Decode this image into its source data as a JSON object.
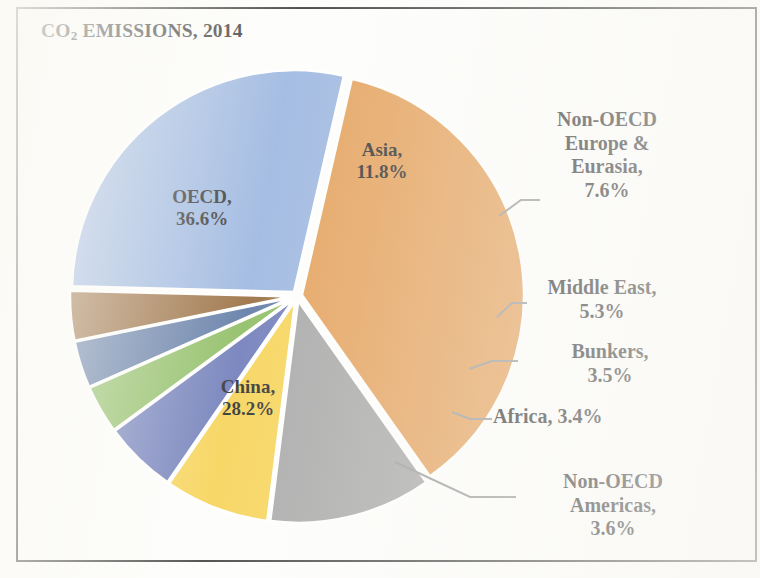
{
  "chart_data": {
    "type": "pie",
    "title": "CO2 EMISSIONS, 2014",
    "title_main": "CO",
    "title_sub": "2",
    "title_rest": " EMISSIONS, 2014",
    "xlabel": "",
    "ylabel": "",
    "legend_position": "none",
    "grid": false,
    "value_unit": "%",
    "categories": [
      "OECD",
      "Asia",
      "Non-OECD Europe & Eurasia",
      "Middle East",
      "Bunkers",
      "Africa",
      "Non-OECD Americas",
      "China"
    ],
    "values": [
      36.6,
      11.8,
      7.6,
      5.3,
      3.5,
      3.4,
      3.6,
      28.2
    ],
    "colors": [
      "#e09343",
      "#9a9a9a",
      "#f5cd40",
      "#5c6bb0",
      "#7eb44d",
      "#4a6899",
      "#8c5a26",
      "#8faddc"
    ],
    "slices": [
      {
        "name": "OECD",
        "value": 36.6,
        "color": "#e09343",
        "label": "OECD,\n36.6%",
        "label_placement": "inside"
      },
      {
        "name": "Asia",
        "value": 11.8,
        "color": "#9a9a9a",
        "label": "Asia,\n11.8%",
        "label_placement": "inside"
      },
      {
        "name": "Non-OECD Europe & Eurasia",
        "value": 7.6,
        "color": "#f5cd40",
        "label": "Non-OECD\nEurope &\nEurasia,\n7.6%",
        "label_placement": "outside"
      },
      {
        "name": "Middle East",
        "value": 5.3,
        "color": "#5c6bb0",
        "label": "Middle East,\n5.3%",
        "label_placement": "outside"
      },
      {
        "name": "Bunkers",
        "value": 3.5,
        "color": "#7eb44d",
        "label": "Bunkers,\n3.5%",
        "label_placement": "outside"
      },
      {
        "name": "Africa",
        "value": 3.4,
        "color": "#4a6899",
        "label": "Africa, 3.4%",
        "label_placement": "outside"
      },
      {
        "name": "Non-OECD Americas",
        "value": 3.6,
        "color": "#8c5a26",
        "label": "Non-OECD\nAmericas,\n3.6%",
        "label_placement": "outside"
      },
      {
        "name": "China",
        "value": 28.2,
        "color": "#8faddc",
        "label": "China,\n28.2%",
        "label_placement": "inside"
      }
    ]
  },
  "labels": {
    "oecd": "OECD,\n36.6%",
    "asia": "Asia,\n11.8%",
    "non_oecd_europe_eurasia": "Non-OECD\nEurope &\nEurasia,\n7.6%",
    "middle_east": "Middle East,\n5.3%",
    "bunkers": "Bunkers,\n3.5%",
    "africa": "Africa, 3.4%",
    "non_oecd_americas": "Non-OECD\nAmericas,\n3.6%",
    "china": "China,\n28.2%"
  },
  "style": {
    "frame_color": "#2b2b2b",
    "background": "#fdfdfb",
    "text_color": "#141414",
    "leader_line_color": "#8a8a8a"
  }
}
